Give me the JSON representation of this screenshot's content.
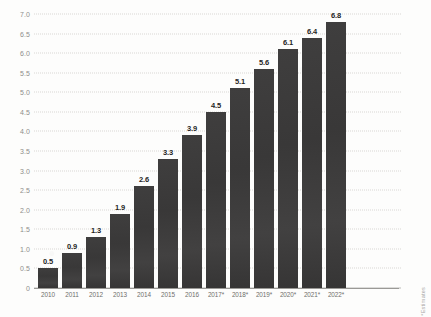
{
  "chart_data": {
    "type": "bar",
    "title": "",
    "subtitle": "",
    "xlabel": "",
    "ylabel": "",
    "categories": [
      "2010",
      "2011",
      "2012",
      "2013",
      "2014",
      "2015",
      "2016",
      "2017*",
      "2018*",
      "2019*",
      "2020*",
      "2021*",
      "2022*"
    ],
    "values": [
      0.5,
      0.9,
      1.3,
      1.9,
      2.6,
      3.3,
      3.9,
      4.5,
      5.1,
      5.6,
      6.1,
      6.4,
      6.8
    ],
    "data_labels": [
      "0.5",
      "0.9",
      "1.3",
      "1.9",
      "2.6",
      "3.3",
      "3.9",
      "4.5",
      "5.1",
      "5.6",
      "6.1",
      "6.4",
      "6.8"
    ],
    "ylim": [
      0,
      7.0
    ],
    "ytick_values": [
      0,
      0.5,
      1.0,
      1.5,
      2.0,
      2.5,
      3.0,
      3.5,
      4.0,
      4.5,
      5.0,
      5.5,
      6.0,
      6.5,
      7.0
    ],
    "ytick_labels": [
      "0",
      "0.5",
      "1.0",
      "1.5",
      "2.0",
      "2.5",
      "3.0",
      "3.5",
      "4.0",
      "4.5",
      "5.0",
      "5.5",
      "6.0",
      "6.5",
      "7.0"
    ],
    "grid": true,
    "grid_style": "dotted",
    "legend": "none",
    "bar_color": "#3c3b3b",
    "grid_color": "#d9d8d4",
    "axis_color": "#9a9996",
    "tick_label_color": "#8e8d8a"
  },
  "annotations": {
    "footnote": "*Estimates"
  }
}
